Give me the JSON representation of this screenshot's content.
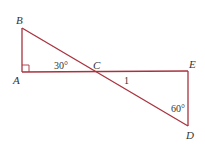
{
  "diagram": {
    "type": "geometry",
    "line_color": "#a8323e",
    "points": {
      "A": {
        "label": "A",
        "x": 22,
        "y": 72
      },
      "B": {
        "label": "B",
        "x": 22,
        "y": 28
      },
      "C": {
        "label": "C",
        "x": 94,
        "y": 72
      },
      "D": {
        "label": "D",
        "x": 188,
        "y": 126
      },
      "E": {
        "label": "E",
        "x": 188,
        "y": 71
      }
    },
    "annotations": {
      "angle_ACB": "30°",
      "angle_CDE": "60°",
      "length_CD": "1",
      "right_angle_at": "A"
    }
  }
}
